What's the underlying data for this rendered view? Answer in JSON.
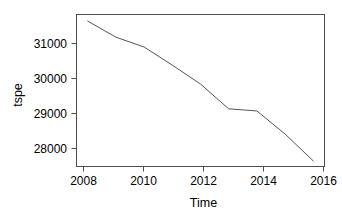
{
  "chart_data": {
    "type": "line",
    "title": "",
    "subtitle": "",
    "xlabel": "Time",
    "ylabel": "tspe",
    "x": [
      2008,
      2009,
      2010,
      2011,
      2012,
      2013,
      2014,
      2015,
      2016
    ],
    "values": [
      31660,
      31200,
      30920,
      30400,
      29860,
      29150,
      29090,
      28430,
      27660
    ],
    "series": [
      {
        "name": "tspe",
        "values": [
          31660,
          31200,
          30920,
          30400,
          29860,
          29150,
          29090,
          28430,
          27660
        ]
      }
    ],
    "xlim": [
      2007.6,
      2016.4
    ],
    "ylim": [
      27500,
      31850
    ],
    "xticks": [
      2008,
      2010,
      2012,
      2014,
      2016
    ],
    "xtick_labels": [
      "2008",
      "2010",
      "2012",
      "2014",
      "2016"
    ],
    "yticks": [
      28000,
      29000,
      30000,
      31000
    ],
    "ytick_labels": [
      "28000",
      "29000",
      "30000",
      "31000"
    ],
    "grid": false,
    "legend": false,
    "legend_position": "none",
    "line_color": "#555555",
    "axis_color": "#4d4d4d",
    "background_color": "#ffffff"
  },
  "axes": {
    "x_axis_title": "Time",
    "y_axis_title": "tspe",
    "x_tick_labels": [
      "2008",
      "2010",
      "2012",
      "2014",
      "2016"
    ],
    "y_tick_labels": [
      "31000",
      "30000",
      "29000",
      "28000"
    ]
  }
}
